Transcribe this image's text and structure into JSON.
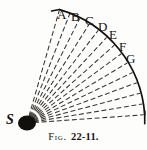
{
  "figure": {
    "caption_label": "Fig.",
    "caption_number": "22-11.",
    "source_label": "S",
    "arc_labels": [
      {
        "text": "A",
        "x": 57,
        "y": 8
      },
      {
        "text": "B",
        "x": 71,
        "y": 10
      },
      {
        "text": "C",
        "x": 85,
        "y": 14
      },
      {
        "text": "D",
        "x": 98,
        "y": 20
      },
      {
        "text": "E",
        "x": 109,
        "y": 28
      },
      {
        "text": "F",
        "x": 119,
        "y": 40
      },
      {
        "text": "G",
        "x": 126,
        "y": 52
      }
    ],
    "colors": {
      "ink": "#141210",
      "background": "#fdfdfb",
      "ray": "#3b3834",
      "arc": "#141210"
    },
    "geometry": {
      "source_x": 27,
      "source_y": 123,
      "source_radius_x": 9,
      "source_radius_y": 7.5,
      "arc_radius": 118,
      "ray_count": 14,
      "angle_start_deg": -74,
      "angle_end_deg": -4
    }
  }
}
